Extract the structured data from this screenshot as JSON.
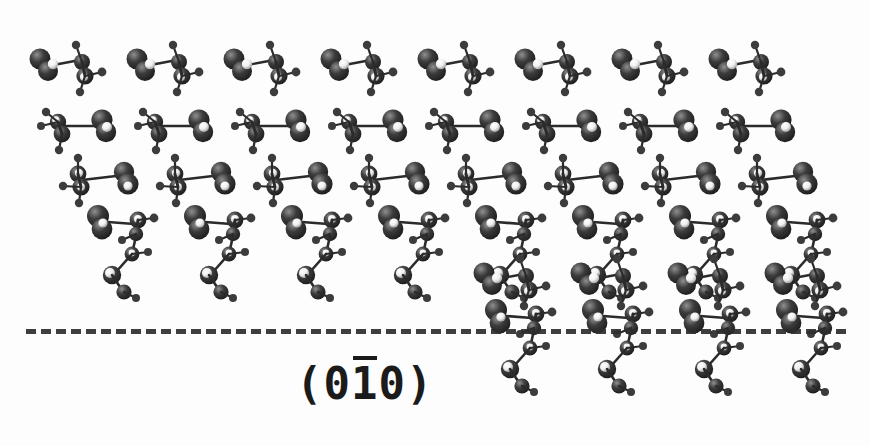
{
  "figure": {
    "kind": "molecular-crystal-lattice-diagram",
    "background_color": "#fdfdfd",
    "caption_label": "(010)",
    "miller_index": {
      "open_paren": "(",
      "h": "0",
      "k": "1",
      "k_has_overbar": true,
      "l": "0",
      "close_paren": ")",
      "full_text": "(010)",
      "x": 296,
      "y": 358,
      "font_size": 44,
      "color": "#1b1b1b"
    },
    "plane_line": {
      "name": "surface-plane-dashed-line",
      "x": 26,
      "y": 329,
      "width": 820,
      "thickness": 5,
      "dash_color": "#2e2e2e",
      "style": "dashed"
    },
    "atoms": {
      "heavy_color": "#3c3c3c",
      "heavy_shadow": "#1c1c1c",
      "heavy_highlight": "#8f8f8f",
      "light_color": "#efefef",
      "light_shadow": "#9a9a9a",
      "bond_color": "#2b2b2b"
    },
    "lattice": {
      "columns": 8,
      "column_spacing": 97,
      "terrace_rows": 4,
      "step_rows": 2,
      "step_starts_at_column": 4,
      "row_stagger_x": 18
    },
    "rows": [
      {
        "name": "terrace-row-1",
        "y": 26,
        "x0": 22,
        "count": 8,
        "variant": "A",
        "tail": false
      },
      {
        "name": "terrace-row-2",
        "y": 82,
        "x0": 28,
        "count": 8,
        "variant": "B",
        "tail": false
      },
      {
        "name": "terrace-row-3",
        "y": 140,
        "x0": 48,
        "count": 8,
        "variant": "C",
        "tail": false
      },
      {
        "name": "terrace-row-4",
        "y": 192,
        "x0": 78,
        "count": 8,
        "variant": "D",
        "tail": true
      },
      {
        "name": "step-row-5",
        "y": 240,
        "x0": 466,
        "count": 4,
        "variant": "A",
        "tail": false
      },
      {
        "name": "step-row-6",
        "y": 286,
        "x0": 476,
        "count": 4,
        "variant": "D",
        "tail": true
      }
    ]
  }
}
